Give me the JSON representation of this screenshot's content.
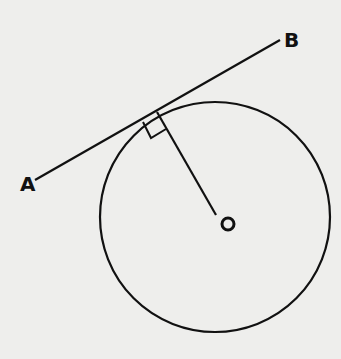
{
  "diagram": {
    "type": "geometry",
    "colors": {
      "background": "#eeeeec",
      "stroke": "#111111"
    },
    "labels": {
      "A": "A",
      "B": "B",
      "O": "O"
    },
    "circle": {
      "cx": 215,
      "cy": 217,
      "r": 115
    },
    "tangent_line": {
      "x1": 35,
      "y1": 180,
      "x2": 280,
      "y2": 40
    },
    "tangent_point": {
      "x": 158,
      "y": 112
    },
    "radius_end": {
      "x": 216,
      "y": 215
    },
    "right_angle_marker": true
  }
}
